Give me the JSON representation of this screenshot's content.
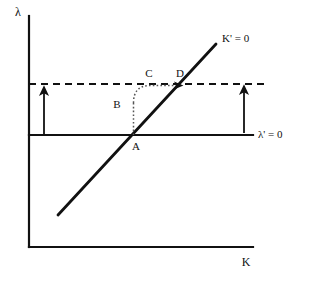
{
  "diagram": {
    "background_color": "#ffffff",
    "ink_color": "#111111",
    "axes": {
      "y_axis": {
        "label": "λ",
        "label_x": 18,
        "label_y": 16,
        "x": 29,
        "y_top": 16,
        "y_bottom": 247
      },
      "x_axis": {
        "label": "K",
        "label_x": 246,
        "label_y": 266,
        "y": 247,
        "x_left": 29,
        "x_right": 253
      }
    },
    "loci": {
      "k_dot_zero": {
        "label": "K' = 0",
        "label_x": 222,
        "label_y": 42,
        "type": "solid-diagonal",
        "x1": 58,
        "y1": 215,
        "x2": 216,
        "y2": 44,
        "stroke_width": 2.6
      },
      "lambda_dot_zero": {
        "label": "λ' = 0",
        "label_x": 258,
        "label_y": 138,
        "type": "solid-horizontal",
        "x1": 29,
        "y1": 135,
        "x2": 253,
        "y2": 135,
        "stroke_width": 2.2
      }
    },
    "dashed_level_line": {
      "type": "dashed-horizontal",
      "x1": 29,
      "y1": 84,
      "x2": 265,
      "y2": 84,
      "dash_pattern": "7,5",
      "stroke_width": 1.8
    },
    "direction_arrows": [
      {
        "name": "left-up-arrow",
        "x": 44,
        "y_tail": 135,
        "y_head": 88,
        "direction": "up"
      },
      {
        "name": "right-up-arrow",
        "x": 244,
        "y_tail": 133,
        "y_head": 87,
        "direction": "up"
      }
    ],
    "trajectory": {
      "name": "saddle-path-adjustment",
      "style": "dotted",
      "stroke_width": 1.4,
      "segments": {
        "vertical_x": 133.5,
        "vertical_y_start": 135,
        "vertical_y_end": 103,
        "arc_end_x": 149,
        "arc_end_y": 86,
        "horizontal_y": 85.5,
        "horizontal_x_start": 149,
        "horizontal_x_end": 182
      }
    },
    "points": [
      {
        "id": "A",
        "label": "A",
        "x": 134,
        "y": 135,
        "label_x": 136,
        "label_y": 150
      },
      {
        "id": "B",
        "label": "B",
        "x": 133,
        "y": 103,
        "label_x": 115,
        "label_y": 108
      },
      {
        "id": "C",
        "label": "C",
        "x": 149,
        "y": 85,
        "label_x": 147,
        "label_y": 77
      },
      {
        "id": "D",
        "label": "D",
        "x": 182,
        "y": 85,
        "label_x": 176,
        "label_y": 77
      }
    ]
  }
}
